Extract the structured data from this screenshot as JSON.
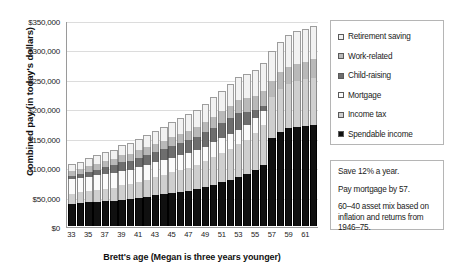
{
  "axes": {
    "y_title": "Combined pay (in today's dollars)",
    "x_title": "Brett's age (Megan is three years younger)",
    "y_ticks": [
      "$0",
      "$50,000",
      "$100,000",
      "$150,000",
      "$200,000",
      "$250,000",
      "$300,000",
      "$350,000"
    ]
  },
  "legend": {
    "items": [
      {
        "label": "Retirement saving",
        "swatch": "swatch-retirement-saving",
        "color": "#f2f2f2"
      },
      {
        "label": "Work-related",
        "swatch": "swatch-work-related",
        "color": "#b9b9b9"
      },
      {
        "label": "Child-raising",
        "swatch": "swatch-child-raising",
        "color": "#6e6e6e"
      },
      {
        "label": "Mortgage",
        "swatch": "swatch-mortgage",
        "color": "#fbfbfb"
      },
      {
        "label": "Income tax",
        "swatch": "swatch-income-tax",
        "color": "#cfcfcf"
      },
      {
        "label": "Spendable income",
        "swatch": "swatch-spendable-income",
        "color": "#101010"
      }
    ]
  },
  "notes": {
    "lines": [
      "Save 12% a year.",
      "Pay mortgage by 57.",
      "60–40 asset mix based on inflation and returns from 1946–75."
    ]
  },
  "chart_data": {
    "type": "bar",
    "stacked": true,
    "title": "",
    "xlabel": "Brett's age (Megan is three years younger)",
    "ylabel": "Combined pay (in today's dollars)",
    "ylim": [
      0,
      350000
    ],
    "ytick_step": 50000,
    "grid": true,
    "legend_position": "right",
    "categories": [
      33,
      34,
      35,
      36,
      37,
      38,
      39,
      40,
      41,
      42,
      43,
      44,
      45,
      46,
      47,
      48,
      49,
      50,
      51,
      52,
      53,
      54,
      55,
      56,
      57,
      58,
      59,
      60,
      61,
      62
    ],
    "tick_labels_shown": [
      33,
      35,
      37,
      39,
      41,
      43,
      45,
      47,
      49,
      51,
      53,
      55,
      57,
      59,
      61
    ],
    "stack_order_bottom_to_top": [
      "Spendable income",
      "Income tax",
      "Mortgage",
      "Child-raising",
      "Work-related",
      "Retirement saving"
    ],
    "series": [
      {
        "name": "Spendable income",
        "values": [
          38000,
          39000,
          40000,
          41000,
          42000,
          43000,
          45000,
          46000,
          48000,
          50000,
          52000,
          54000,
          56000,
          58000,
          60000,
          63000,
          66000,
          70000,
          74000,
          78000,
          83000,
          88000,
          95000,
          104000,
          150000,
          160000,
          166000,
          168000,
          170000,
          172000
        ]
      },
      {
        "name": "Income tax",
        "values": [
          17000,
          18000,
          19000,
          20000,
          21000,
          22000,
          24000,
          25000,
          27000,
          29000,
          31000,
          33000,
          35000,
          37000,
          39000,
          41000,
          44000,
          47000,
          50000,
          53000,
          56000,
          59000,
          63000,
          67000,
          70000,
          73000,
          76000,
          78000,
          79000,
          80000
        ]
      },
      {
        "name": "Mortgage",
        "values": [
          25000,
          25000,
          25000,
          25000,
          25000,
          25000,
          25000,
          25000,
          25000,
          25000,
          25000,
          25000,
          25000,
          25000,
          25000,
          25000,
          25000,
          25000,
          25000,
          25000,
          25000,
          25000,
          25000,
          25000,
          0,
          0,
          0,
          0,
          0,
          0
        ]
      },
      {
        "name": "Child-raising",
        "values": [
          5000,
          6000,
          8000,
          10000,
          12000,
          13000,
          14000,
          15000,
          16000,
          17000,
          18000,
          19000,
          20000,
          21000,
          22000,
          23000,
          24000,
          25000,
          26000,
          27000,
          28000,
          22000,
          14000,
          8000,
          0,
          0,
          0,
          0,
          0,
          0
        ]
      },
      {
        "name": "Work-related",
        "values": [
          9000,
          9000,
          10000,
          10000,
          11000,
          11000,
          12000,
          12000,
          13000,
          13000,
          14000,
          14000,
          15000,
          16000,
          16000,
          17000,
          18000,
          19000,
          20000,
          21000,
          22000,
          23000,
          24000,
          26000,
          27000,
          28000,
          29000,
          30000,
          30000,
          31000
        ]
      },
      {
        "name": "Retirement saving",
        "values": [
          11000,
          12000,
          13000,
          14000,
          15000,
          16000,
          17000,
          18000,
          19000,
          21000,
          22000,
          23000,
          25000,
          26000,
          28000,
          29000,
          31000,
          33000,
          35000,
          37000,
          39000,
          41000,
          44000,
          47000,
          50000,
          52000,
          54000,
          55000,
          56000,
          57000
        ]
      }
    ],
    "totals": [
      105000,
      109000,
      115000,
      120000,
      126000,
      130000,
      137000,
      141000,
      148000,
      155000,
      162000,
      168000,
      176000,
      183000,
      190000,
      198000,
      208000,
      219000,
      230000,
      241000,
      253000,
      258000,
      265000,
      277000,
      297000,
      313000,
      325000,
      331000,
      335000,
      340000
    ]
  }
}
